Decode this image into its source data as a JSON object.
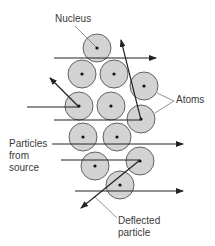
{
  "diagram": {
    "labels": {
      "nucleus": "Nucleus",
      "atoms": "Atoms",
      "particles_line1": "Particles",
      "particles_line2": "from",
      "particles_line3": "source",
      "deflected_line1": "Deflected",
      "deflected_line2": "particle"
    },
    "colors": {
      "atom_fill": "#d3d3d3",
      "atom_stroke": "#555555",
      "nucleus": "#111111",
      "arrow": "#222222",
      "leader": "#666666",
      "text": "#3a3a3a"
    },
    "atoms": [
      {
        "cx": 97,
        "cy": 48
      },
      {
        "cx": 82,
        "cy": 74
      },
      {
        "cx": 114,
        "cy": 74
      },
      {
        "cx": 144,
        "cy": 86
      },
      {
        "cx": 79,
        "cy": 106
      },
      {
        "cx": 111,
        "cy": 106
      },
      {
        "cx": 141,
        "cy": 119
      },
      {
        "cx": 83,
        "cy": 137
      },
      {
        "cx": 117,
        "cy": 137
      },
      {
        "cx": 95,
        "cy": 166
      },
      {
        "cx": 140,
        "cy": 161
      },
      {
        "cx": 120,
        "cy": 185
      }
    ]
  }
}
